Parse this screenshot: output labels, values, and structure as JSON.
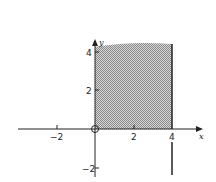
{
  "diagram": {
    "type": "shaded-region-plot",
    "x_axis_label": "x",
    "y_axis_label": "y",
    "x_ticks": [
      {
        "value": -2,
        "label": "−2"
      },
      {
        "value": 2,
        "label": "2"
      },
      {
        "value": 4,
        "label": "4"
      }
    ],
    "y_ticks": [
      {
        "value": 4,
        "label": "4"
      },
      {
        "value": 2,
        "label": "2"
      },
      {
        "value": -2,
        "label": "−2"
      }
    ],
    "shaded_region": {
      "x_min": 0,
      "x_max": 4,
      "y_min": 0,
      "y_max": 4.3
    },
    "vertical_line": {
      "x": 4,
      "y_from": -3,
      "y_to": 4.3
    },
    "origin_marker": "open-circle",
    "colors": {
      "ink": "#222222",
      "shade": "#b8b8b8"
    }
  }
}
